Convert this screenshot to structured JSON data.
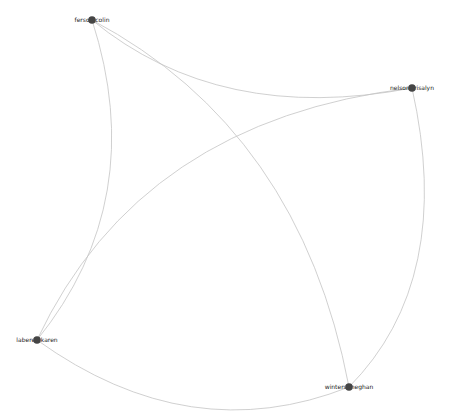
{
  "graph": {
    "type": "network",
    "colors": {
      "background": "#ffffff",
      "edge": "#c4c4c4",
      "node": "#454545",
      "label": "#222222"
    },
    "nodes": [
      {
        "id": "ferson",
        "label": "ferson colin",
        "x": 92,
        "y": 20
      },
      {
        "id": "nelson",
        "label": "nelson trisalyn",
        "x": 412,
        "y": 88
      },
      {
        "id": "laberee",
        "label": "laberee karen",
        "x": 37,
        "y": 340
      },
      {
        "id": "winters",
        "label": "winters meghan",
        "x": 349,
        "y": 387
      }
    ],
    "edges": [
      {
        "source": "ferson",
        "target": "nelson"
      },
      {
        "source": "ferson",
        "target": "winters"
      },
      {
        "source": "ferson",
        "target": "laberee"
      },
      {
        "source": "nelson",
        "target": "laberee"
      },
      {
        "source": "nelson",
        "target": "winters"
      },
      {
        "source": "laberee",
        "target": "winters"
      }
    ]
  }
}
